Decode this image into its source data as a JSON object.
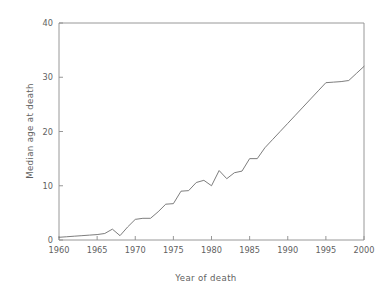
{
  "chart_data": {
    "type": "line",
    "title": "",
    "xlabel": "Year  of death",
    "ylabel": "Median age at death",
    "xlim": [
      1960,
      2000
    ],
    "ylim": [
      0,
      40
    ],
    "grid": false,
    "legend": null,
    "x_ticks": [
      1960,
      1965,
      1970,
      1975,
      1980,
      1985,
      1990,
      1995,
      2000
    ],
    "x_tick_labels": [
      "1960",
      "1965",
      "1970",
      "1975",
      "1980",
      "1985",
      "1990",
      "1995",
      "2000"
    ],
    "y_ticks": [
      0,
      10,
      20,
      30,
      40
    ],
    "y_tick_labels": [
      "0",
      "10",
      "20",
      "30",
      "40"
    ],
    "x": [
      1960,
      1961,
      1962,
      1963,
      1964,
      1965,
      1966,
      1967,
      1968,
      1969,
      1970,
      1971,
      1972,
      1973,
      1974,
      1975,
      1976,
      1977,
      1978,
      1979,
      1980,
      1981,
      1982,
      1983,
      1984,
      1985,
      1986,
      1987,
      1988,
      1989,
      1990,
      1991,
      1992,
      1993,
      1994,
      1995,
      1996,
      1997,
      1998,
      1999,
      2000
    ],
    "values": [
      0.5,
      0.6,
      0.7,
      0.8,
      0.9,
      1.0,
      1.2,
      2.0,
      0.8,
      2.4,
      3.8,
      4.0,
      4.0,
      5.2,
      6.6,
      6.7,
      9.0,
      9.1,
      10.6,
      11.0,
      10.0,
      12.8,
      11.3,
      12.4,
      12.7,
      15.0,
      15.0,
      17.0,
      18.5,
      20.0,
      21.5,
      23.0,
      24.5,
      26.0,
      27.5,
      29.0,
      29.1,
      29.2,
      29.4,
      30.7,
      32.0
    ],
    "series": [
      {
        "name": "Median age at death",
        "color": "#6e6e6e",
        "values": [
          0.5,
          0.6,
          0.7,
          0.8,
          0.9,
          1.0,
          1.2,
          2.0,
          0.8,
          2.4,
          3.8,
          4.0,
          4.0,
          5.2,
          6.6,
          6.7,
          9.0,
          9.1,
          10.6,
          11.0,
          10.0,
          12.8,
          11.3,
          12.4,
          12.7,
          15.0,
          15.0,
          17.0,
          18.5,
          20.0,
          21.5,
          23.0,
          24.5,
          26.0,
          27.5,
          29.0,
          29.1,
          29.2,
          29.4,
          30.7,
          32.0
        ]
      }
    ],
    "colors": {
      "line": "#6e6e6e",
      "axis": "#8c8c8c",
      "text": "#5f5f5f",
      "background": "#ffffff"
    }
  }
}
